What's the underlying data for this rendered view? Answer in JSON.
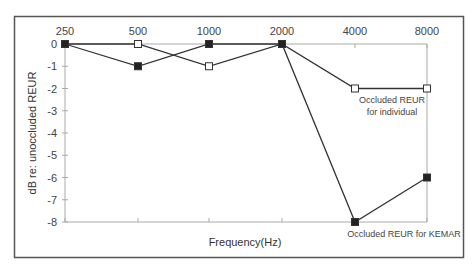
{
  "chart_data": {
    "type": "line",
    "title": "",
    "xlabel": "Frequency(Hz)",
    "ylabel": "dB re: unoccluded REUR",
    "categories": [
      "250",
      "500",
      "1000",
      "2000",
      "4000",
      "8000"
    ],
    "x": [
      250,
      500,
      1000,
      2000,
      4000,
      8000
    ],
    "ylim": [
      -8,
      0
    ],
    "yticks": [
      0,
      -1,
      -2,
      -3,
      -4,
      -5,
      -6,
      -7,
      -8
    ],
    "x_axis_position": "top",
    "grid": false,
    "legend_position": "inline annotations",
    "series": [
      {
        "name": "Occluded REUR for individual",
        "marker": "open-square",
        "values": [
          0,
          0,
          -1,
          0,
          -2,
          -2
        ]
      },
      {
        "name": "Occluded REUR for KEMAR",
        "marker": "filled-square",
        "values": [
          0,
          -1,
          0,
          0,
          -8,
          -6
        ]
      }
    ],
    "annotations": [
      {
        "text_lines": [
          "Occluded REUR",
          "for individual"
        ],
        "near_series": "Occluded REUR for individual"
      },
      {
        "text_lines": [
          "Occluded REUR for KEMAR"
        ],
        "near_series": "Occluded REUR for KEMAR"
      }
    ]
  },
  "colors": {
    "frame": "#555555",
    "axis": "#aaaaaa",
    "line": "#333333",
    "filled_marker": "#222222",
    "open_marker_fill": "#ffffff"
  }
}
